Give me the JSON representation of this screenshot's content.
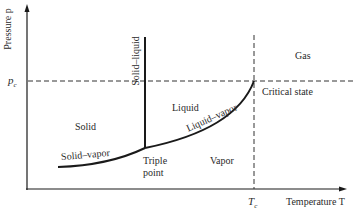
{
  "diagram": {
    "type": "phase-diagram",
    "axes": {
      "y_label": "Pressure p",
      "x_label": "Temperature T",
      "pc_tick": "p",
      "pc_sub": "c",
      "tc_tick": "T",
      "tc_sub": "c"
    },
    "regions": {
      "solid": "Solid",
      "liquid": "Liquid",
      "vapor": "Vapor",
      "gas": "Gas"
    },
    "curves": {
      "solid_liquid": "Solid–liquid",
      "solid_vapor": "Solid–vapor",
      "liquid_vapor": "Liquid–vapor"
    },
    "points": {
      "triple_line1": "Triple",
      "triple_line2": "point",
      "critical": "Critical state"
    },
    "colors": {
      "ink": "#1a1a1a",
      "background": "#ffffff"
    }
  }
}
